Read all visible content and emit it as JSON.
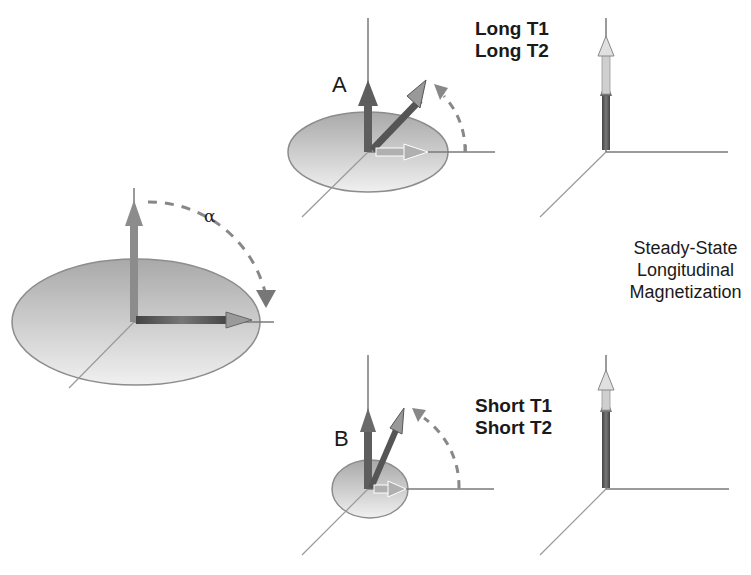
{
  "figure": {
    "alpha_label": "α",
    "panel_a": {
      "label": "A",
      "title_lines": [
        "Long T1",
        "Long T2"
      ]
    },
    "panel_b": {
      "label": "B",
      "title_lines": [
        "Short T1",
        "Short T2"
      ]
    },
    "right_caption_lines": [
      "Steady-State",
      "Longitudinal",
      "Magnetization"
    ]
  },
  "colors": {
    "axis": "#7a7a7a",
    "arrow_dark": "#555555",
    "arrow_light": "#b5b5b5",
    "disk_fill": "#cfcfcf",
    "disk_stroke": "#8a8a8a",
    "dash": "#888888",
    "text": "#1a1a1a"
  }
}
